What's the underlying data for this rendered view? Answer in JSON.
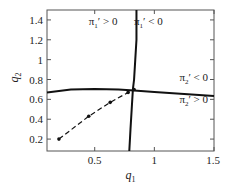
{
  "chart_data": {
    "type": "line",
    "title": "",
    "xlabel": "q1",
    "ylabel": "q2",
    "xlim": [
      0.1,
      1.5
    ],
    "ylim": [
      0.08,
      1.5
    ],
    "xticks": [
      0.5,
      1,
      1.5
    ],
    "yticks": [
      0.2,
      0.4,
      0.6,
      0.8,
      1,
      1.2,
      1.4
    ],
    "xtick_labels": [
      "0.5",
      "1",
      "1.5"
    ],
    "ytick_labels": [
      "0.2",
      "0.4",
      "0.6",
      "0.8",
      "1",
      "1.2",
      "1.4"
    ],
    "grid": false,
    "series": [
      {
        "name": "pi1' = 0 curve",
        "style": "solid",
        "x": [
          0.85,
          0.85,
          0.84,
          0.83,
          0.82,
          0.81,
          0.8,
          0.79
        ],
        "y": [
          1.5,
          1.2,
          1.0,
          0.8,
          0.7,
          0.5,
          0.3,
          0.08
        ]
      },
      {
        "name": "pi2' = 0 curve",
        "style": "solid",
        "x": [
          0.1,
          0.3,
          0.5,
          0.7,
          0.83,
          1.0,
          1.25,
          1.5
        ],
        "y": [
          0.67,
          0.7,
          0.705,
          0.7,
          0.69,
          0.675,
          0.655,
          0.635
        ]
      },
      {
        "name": "iteration path",
        "style": "dashed",
        "markers": true,
        "x": [
          0.2,
          0.45,
          0.63,
          0.78,
          0.83
        ],
        "y": [
          0.2,
          0.43,
          0.57,
          0.67,
          0.7
        ]
      }
    ],
    "annotations": [
      {
        "text": "π1' > 0",
        "x": 0.57,
        "y": 1.35
      },
      {
        "text": "π1' < 0",
        "x": 0.95,
        "y": 1.35
      },
      {
        "text": "π2' < 0",
        "x": 1.33,
        "y": 0.78
      },
      {
        "text": "π2' > 0",
        "x": 1.33,
        "y": 0.56
      }
    ]
  },
  "labels": {
    "xlabel": "q",
    "xlabel_sub": "1",
    "ylabel": "q",
    "ylabel_sub": "2",
    "ann": [
      {
        "main": "π",
        "sub": "1",
        "rest": "′ > 0"
      },
      {
        "main": "π",
        "sub": "1",
        "rest": "′ < 0"
      },
      {
        "main": "π",
        "sub": "2",
        "rest": "′ < 0"
      },
      {
        "main": "π",
        "sub": "2",
        "rest": "′ > 0"
      }
    ]
  }
}
